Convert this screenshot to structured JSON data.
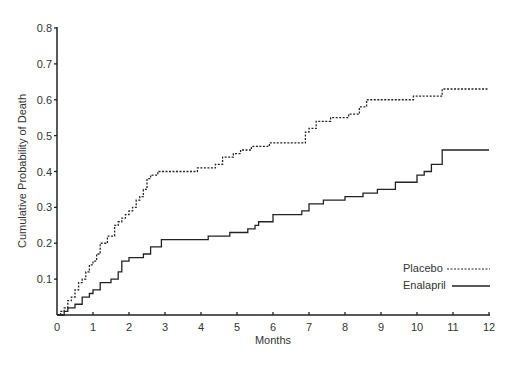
{
  "chart_data": {
    "type": "line",
    "subtype": "step (Kaplan-Meier cumulative incidence)",
    "title": "",
    "xlabel": "Months",
    "ylabel": "Cumulative Probability of Death",
    "xlim": [
      0,
      12
    ],
    "ylim": [
      0,
      0.8
    ],
    "x_ticks": [
      "0",
      "1",
      "2",
      "3",
      "4",
      "5",
      "6",
      "7",
      "8",
      "9",
      "10",
      "11",
      "12"
    ],
    "y_ticks": [
      "0.1",
      "0.2",
      "0.3",
      "0.4",
      "0.5",
      "0.6",
      "0.7",
      "0.8"
    ],
    "grid": false,
    "legend_position": "lower right",
    "series": [
      {
        "name": "Placebo",
        "line_style": "dashed",
        "x": [
          0,
          0.1,
          0.2,
          0.3,
          0.4,
          0.5,
          0.6,
          0.7,
          0.8,
          0.9,
          1.0,
          1.1,
          1.2,
          1.4,
          1.6,
          1.7,
          1.8,
          1.9,
          2.0,
          2.1,
          2.2,
          2.3,
          2.4,
          2.5,
          2.6,
          2.8,
          3.0,
          3.2,
          3.9,
          4.2,
          4.4,
          4.6,
          4.9,
          5.1,
          5.4,
          5.7,
          5.9,
          6.8,
          6.9,
          7.0,
          7.2,
          7.6,
          8.1,
          8.4,
          8.6,
          9.9,
          10.7,
          12.0
        ],
        "values": [
          0,
          0.01,
          0.02,
          0.04,
          0.05,
          0.07,
          0.09,
          0.1,
          0.12,
          0.14,
          0.15,
          0.17,
          0.2,
          0.22,
          0.25,
          0.26,
          0.27,
          0.28,
          0.29,
          0.3,
          0.32,
          0.33,
          0.35,
          0.38,
          0.39,
          0.4,
          0.4,
          0.4,
          0.41,
          0.41,
          0.42,
          0.44,
          0.45,
          0.46,
          0.47,
          0.47,
          0.48,
          0.48,
          0.51,
          0.52,
          0.54,
          0.55,
          0.56,
          0.58,
          0.6,
          0.61,
          0.63,
          0.63
        ]
      },
      {
        "name": "Enalapril",
        "line_style": "solid",
        "x": [
          0,
          0.2,
          0.3,
          0.5,
          0.7,
          0.9,
          1.0,
          1.2,
          1.5,
          1.7,
          1.8,
          2.0,
          2.4,
          2.6,
          2.9,
          3.6,
          4.2,
          4.8,
          5.3,
          5.5,
          5.6,
          6.0,
          6.8,
          7.0,
          7.4,
          8.0,
          8.5,
          8.9,
          9.4,
          10.0,
          10.2,
          10.4,
          10.7,
          12.0
        ],
        "values": [
          0,
          0.01,
          0.02,
          0.03,
          0.05,
          0.06,
          0.07,
          0.09,
          0.1,
          0.12,
          0.15,
          0.16,
          0.17,
          0.19,
          0.21,
          0.21,
          0.22,
          0.23,
          0.24,
          0.25,
          0.26,
          0.28,
          0.29,
          0.31,
          0.32,
          0.33,
          0.34,
          0.35,
          0.37,
          0.39,
          0.4,
          0.42,
          0.46,
          0.46
        ]
      }
    ]
  },
  "legend": {
    "items": [
      {
        "label": "Placebo",
        "style": "dashed"
      },
      {
        "label": "Enalapril",
        "style": "solid"
      }
    ]
  },
  "colors": {
    "ink": "#222222",
    "background": "#ffffff"
  }
}
